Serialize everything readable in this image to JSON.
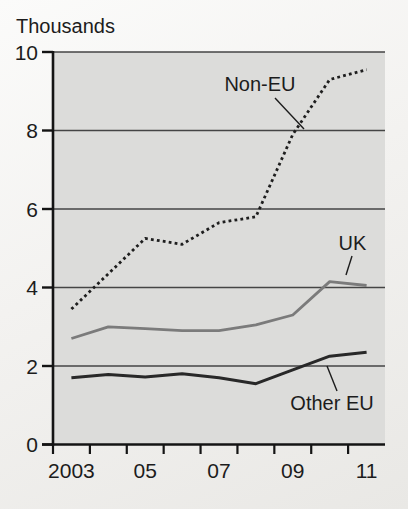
{
  "chart_data": {
    "type": "line",
    "title": "",
    "ylabel": "Thousands",
    "xlabel": "",
    "x": [
      2003,
      2004,
      2005,
      2006,
      2007,
      2008,
      2009,
      2010,
      2011
    ],
    "xticks": [
      {
        "year": 2003,
        "label": "2003"
      },
      {
        "year": 2005,
        "label": "05"
      },
      {
        "year": 2007,
        "label": "07"
      },
      {
        "year": 2009,
        "label": "09"
      },
      {
        "year": 2011,
        "label": "11"
      }
    ],
    "ylim": [
      0,
      10
    ],
    "yticks": [
      0,
      2,
      4,
      6,
      8,
      10
    ],
    "grid": true,
    "legend_position": "inline-annotations",
    "plot_bg_color": "#dcdcda",
    "grid_color": "#454545",
    "axis_color": "#141414",
    "text_color": "#1c1c1c",
    "series": [
      {
        "name": "Non-EU",
        "style": "dotted",
        "color": "#1e1e1e",
        "width": 2.8,
        "values": [
          3.45,
          4.35,
          5.25,
          5.1,
          5.65,
          5.8,
          7.9,
          9.3,
          9.55
        ]
      },
      {
        "name": "UK",
        "style": "solid",
        "color": "#7b7b7b",
        "width": 2.8,
        "values": [
          2.7,
          3.0,
          2.95,
          2.9,
          2.9,
          3.05,
          3.3,
          4.15,
          4.05
        ]
      },
      {
        "name": "Other EU",
        "style": "solid",
        "color": "#282828",
        "width": 3.0,
        "values": [
          1.7,
          1.78,
          1.72,
          1.8,
          1.7,
          1.55,
          1.9,
          2.25,
          2.35
        ]
      }
    ],
    "annotations": [
      {
        "label": "Non-EU",
        "x": 260,
        "y": 84,
        "leader": [
          [
            275,
            98
          ],
          [
            304,
            129
          ]
        ]
      },
      {
        "label": "UK",
        "x": 352.5,
        "y": 243,
        "leader": [
          [
            352,
            256
          ],
          [
            346,
            275
          ]
        ]
      },
      {
        "label": "Other EU",
        "x": 332,
        "y": 403,
        "leader": [
          [
            337,
            391
          ],
          [
            327,
            366
          ]
        ]
      }
    ]
  }
}
